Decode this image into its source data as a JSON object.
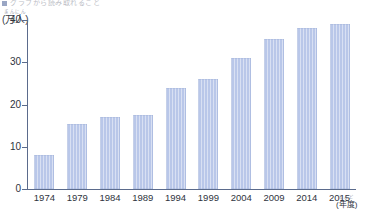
{
  "title": {
    "marker": "square-marker",
    "text": "グラフから読み取れること"
  },
  "axis": {
    "y_unit": "(万人)",
    "y_unit_furigana": "まんにん",
    "x_unit": "(年度)",
    "x_unit_furigana": "ねんど"
  },
  "colors": {
    "bar": "#b9c7e9",
    "axis": "#5b6b8c",
    "text": "#2f3440"
  },
  "chart_data": {
    "type": "bar",
    "title": "グラフから読み取れること",
    "xlabel": "(年度)",
    "ylabel": "(万人)",
    "ylim": [
      0,
      40
    ],
    "yticks": [
      0,
      10,
      20,
      30,
      40
    ],
    "grid": false,
    "legend": "none",
    "categories": [
      "1974",
      "1979",
      "1984",
      "1989",
      "1994",
      "1999",
      "2004",
      "2009",
      "2014",
      "2015"
    ],
    "values": [
      8,
      15.5,
      17,
      17.5,
      24,
      26,
      31,
      35.5,
      38,
      39
    ]
  }
}
